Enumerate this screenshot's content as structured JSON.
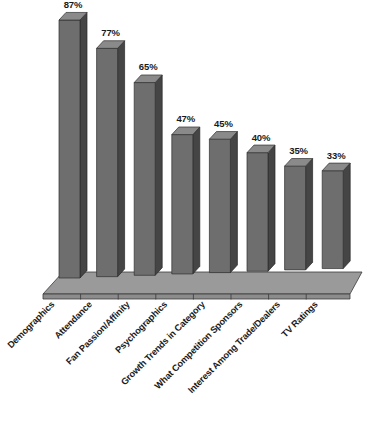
{
  "chart_data": {
    "type": "bar",
    "title": "",
    "subtitle": "",
    "xlabel": "",
    "ylabel": "",
    "ylim": [
      0,
      100
    ],
    "grid": false,
    "legend": false,
    "style": "3d-column",
    "value_suffix": "%",
    "categories": [
      "Demographics",
      "Attendance",
      "Fan Passion/Affinity",
      "Psychographics",
      "Growth Trends in Category",
      "What Competition Sponsors",
      "Interest Among Trade/Dealers",
      "TV Ratings"
    ],
    "values": [
      87,
      77,
      65,
      47,
      45,
      40,
      35,
      33
    ],
    "value_labels": [
      "87%",
      "77%",
      "65%",
      "47%",
      "45%",
      "40%",
      "35%",
      "33%"
    ],
    "colors": {
      "bar_front": "#6e6e6e",
      "bar_side": "#454545",
      "bar_top": "#8a8a8a",
      "floor": "#9a9a9a",
      "background": "#ffffff",
      "text": "#1a1a1a"
    }
  }
}
